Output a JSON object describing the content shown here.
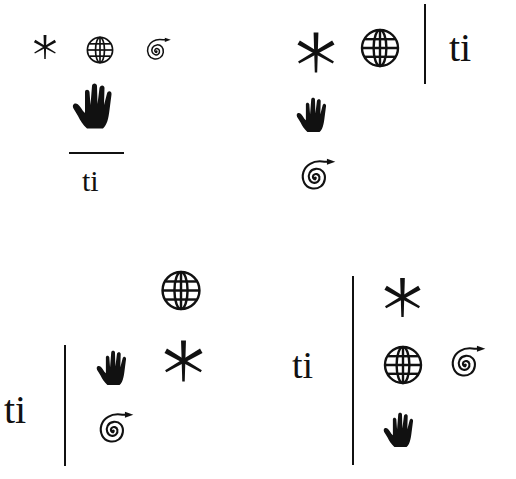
{
  "colors": {
    "ink": "#111111",
    "background": "#ffffff"
  },
  "glyph_label": "ti",
  "panels": [
    {
      "id": "top-left",
      "layout": "horizontal-divider",
      "text": "ti",
      "symbols_row_1": [
        "asterisk-icon",
        "globe-icon",
        "spiral-arrow-icon"
      ],
      "symbols_row_2": [
        "hand-icon"
      ]
    },
    {
      "id": "top-right",
      "layout": "vertical-divider-text-right",
      "text": "ti",
      "symbols_row_1": [
        "asterisk-icon",
        "globe-icon"
      ],
      "symbols_row_2": [
        "hand-icon"
      ],
      "symbols_row_3": [
        "spiral-arrow-icon"
      ]
    },
    {
      "id": "bottom-left",
      "layout": "vertical-divider-text-left",
      "text": "ti",
      "symbols_row_1": [
        "globe-icon"
      ],
      "symbols_row_2": [
        "hand-icon",
        "asterisk-icon"
      ],
      "symbols_row_3": [
        "spiral-arrow-icon"
      ]
    },
    {
      "id": "bottom-right",
      "layout": "vertical-divider-text-left",
      "text": "ti",
      "symbols_row_1": [
        "asterisk-icon"
      ],
      "symbols_row_2": [
        "globe-icon",
        "spiral-arrow-icon"
      ],
      "symbols_row_3": [
        "hand-icon"
      ]
    }
  ]
}
